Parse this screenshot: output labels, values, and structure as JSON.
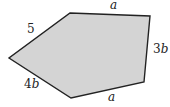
{
  "figure": {
    "type": "pentagon",
    "fill_color": "#d4d4d4",
    "stroke_color": "#222222",
    "background_color": "#ffffff",
    "vertices": [
      [
        70,
        13
      ],
      [
        150,
        16
      ],
      [
        144,
        82
      ],
      [
        71,
        98
      ],
      [
        9,
        58
      ]
    ],
    "sides": [
      {
        "id": "top",
        "coef": "",
        "var": "a",
        "x": 110,
        "y": 9
      },
      {
        "id": "right",
        "coef": "3",
        "var": "b",
        "x": 153,
        "y": 53
      },
      {
        "id": "bottom",
        "coef": "",
        "var": "a",
        "x": 108,
        "y": 101
      },
      {
        "id": "lower-left",
        "coef": "4",
        "var": "b",
        "x": 24,
        "y": 88
      },
      {
        "id": "upper-left",
        "coef": "5",
        "var": "",
        "x": 27,
        "y": 33
      }
    ]
  }
}
